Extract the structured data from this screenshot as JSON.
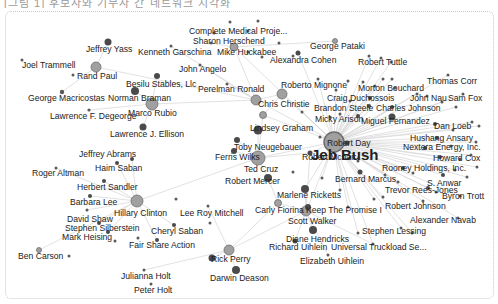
{
  "top_caption": "[그림 1] 후보자와 기부자 간 네트워크 시각화",
  "colors": {
    "edge": "#d9d9d9",
    "candidate_fill": "#a0a0a0",
    "candidate_stroke": "#6e6e6e",
    "donor_fill": "#4a4a4a",
    "small_fill": "#5a5a5a",
    "light_fill": "#9a9a9a",
    "label": "#222222",
    "frame_border": "#c8c8c8"
  },
  "nodes": [
    {
      "id": "jeb",
      "label": "Jeb Bush",
      "x": 334,
      "y": 142,
      "r": 10,
      "kind": "candidate",
      "lx": 311,
      "ly": 160,
      "hub": true
    },
    {
      "id": "hillary",
      "label": "Hillary Clinton",
      "x": 137,
      "y": 201,
      "r": 6,
      "kind": "candidate",
      "lx": 114,
      "ly": 216
    },
    {
      "id": "rand",
      "label": "Rand Paul",
      "x": 96,
      "y": 67,
      "r": 5,
      "kind": "candidate",
      "lx": 77,
      "ly": 79
    },
    {
      "id": "rubio",
      "label": "Marco Rubio",
      "x": 152,
      "y": 104,
      "r": 6,
      "kind": "candidate",
      "lx": 128,
      "ly": 116
    },
    {
      "id": "christie",
      "label": "Chris Christie",
      "x": 256,
      "y": 100,
      "r": 5,
      "kind": "candidate",
      "lx": 258,
      "ly": 107
    },
    {
      "id": "cruz",
      "label": "Ted Cruz",
      "x": 258,
      "y": 158,
      "r": 7,
      "kind": "candidate",
      "lx": 244,
      "ly": 172
    },
    {
      "id": "walker",
      "label": "Scott Walker",
      "x": 306,
      "y": 211,
      "r": 5,
      "kind": "candidate",
      "lx": 288,
      "ly": 224
    },
    {
      "id": "huckabee",
      "label": "Mike Huckabee",
      "x": 234,
      "y": 47,
      "r": 4,
      "kind": "candidate",
      "lx": 217,
      "ly": 55
    },
    {
      "id": "perry",
      "label": "Rick Perry",
      "x": 229,
      "y": 250,
      "r": 5,
      "kind": "candidate",
      "lx": 211,
      "ly": 262
    },
    {
      "id": "graham",
      "label": "Lindsey Graham",
      "x": 263,
      "y": 115,
      "r": 3.5,
      "kind": "candidate",
      "lx": 250,
      "ly": 131
    },
    {
      "id": "fiorina",
      "label": "Carly Fiorina",
      "x": 278,
      "y": 203,
      "r": 3.5,
      "kind": "candidate",
      "lx": 255,
      "ly": 213
    },
    {
      "id": "pataki",
      "label": "George Pataki",
      "x": 335,
      "y": 41,
      "r": 2.5,
      "kind": "candidate",
      "lx": 310,
      "ly": 49
    },
    {
      "id": "carson",
      "label": "Ben Carson",
      "x": 39,
      "y": 250,
      "r": 2.5,
      "kind": "candidate",
      "lx": 18,
      "ly": 259
    },
    {
      "id": "yass",
      "label": "Jeffrey Yass",
      "x": 108,
      "y": 42,
      "r": 3.5,
      "kind": "donor",
      "lx": 86,
      "ly": 52
    },
    {
      "id": "trammell",
      "label": "Joel Trammell",
      "x": 0,
      "y": 0,
      "r": 0,
      "kind": "none",
      "lx": 22,
      "ly": 68
    },
    {
      "id": "macricostas",
      "label": "George Macricostas",
      "x": 62,
      "y": 92,
      "r": 2.2,
      "kind": "small",
      "lx": 28,
      "ly": 101
    },
    {
      "id": "degeorge",
      "label": "Lawrence F. Degeorge",
      "x": 89,
      "y": 110,
      "r": 1.6,
      "kind": "small",
      "lx": 50,
      "ly": 119
    },
    {
      "id": "ellison",
      "label": "Lawrence J. Ellison",
      "x": 143,
      "y": 127,
      "r": 3.5,
      "kind": "donor",
      "lx": 110,
      "ly": 137
    },
    {
      "id": "braman",
      "label": "Norman Braman",
      "x": 135,
      "y": 91,
      "r": 4,
      "kind": "donor",
      "lx": 108,
      "ly": 101
    },
    {
      "id": "besilu",
      "label": "Besilu Stables, Llc",
      "x": 157,
      "y": 76,
      "r": 3,
      "kind": "donor",
      "lx": 126,
      "ly": 87
    },
    {
      "id": "garschina",
      "label": "Kenneth Garschina",
      "x": 171,
      "y": 46,
      "r": 1.5,
      "kind": "small",
      "lx": 138,
      "ly": 55
    },
    {
      "id": "angelo",
      "label": "John Angelo",
      "x": 200,
      "y": 65,
      "r": 1.5,
      "kind": "small",
      "lx": 179,
      "ly": 72
    },
    {
      "id": "perelman",
      "label": "Perelman Ronald",
      "x": 227,
      "y": 84,
      "r": 1.5,
      "kind": "small",
      "lx": 198,
      "ly": 92
    },
    {
      "id": "cmp",
      "label": "Complete Medical Proje...",
      "x": 248,
      "y": 31,
      "r": 1.5,
      "kind": "small",
      "lx": 189,
      "ly": 34
    },
    {
      "id": "herschend",
      "label": "Sharon Herschend",
      "x": 211,
      "y": 43,
      "r": 1.5,
      "kind": "small",
      "lx": 193,
      "ly": 44
    },
    {
      "id": "cohen",
      "label": "Alexandra Cohen",
      "x": 298,
      "y": 53,
      "r": 2.5,
      "kind": "donor",
      "lx": 270,
      "ly": 63
    },
    {
      "id": "mignone",
      "label": "Roberto Mignone",
      "x": 282,
      "y": 94,
      "r": 5,
      "kind": "candidate",
      "lx": 281,
      "ly": 88
    },
    {
      "id": "tuttle",
      "label": "Robert Tuttle",
      "x": 381,
      "y": 58,
      "r": 1.5,
      "kind": "small",
      "lx": 358,
      "ly": 65
    },
    {
      "id": "corr",
      "label": "Thomas Corr",
      "x": 448,
      "y": 75,
      "r": 1.5,
      "kind": "small",
      "lx": 427,
      "ly": 84
    },
    {
      "id": "bouchard",
      "label": "Morton Bouchard",
      "x": 375,
      "y": 86,
      "r": 1.5,
      "kind": "small",
      "lx": 358,
      "ly": 91
    },
    {
      "id": "nau",
      "label": "John Nau",
      "x": 417,
      "y": 94,
      "r": 1.5,
      "kind": "small",
      "lx": 410,
      "ly": 101
    },
    {
      "id": "samfox",
      "label": "Sam Fox",
      "x": 463,
      "y": 94,
      "r": 1.5,
      "kind": "small",
      "lx": 448,
      "ly": 101
    },
    {
      "id": "duchossois",
      "label": "Craig Duchossois",
      "x": 370,
      "y": 98,
      "r": 2,
      "kind": "donor",
      "lx": 327,
      "ly": 101
    },
    {
      "id": "steele",
      "label": "Brandon Steele",
      "x": 369,
      "y": 106,
      "r": 2,
      "kind": "donor",
      "lx": 314,
      "ly": 111
    },
    {
      "id": "cjohnson",
      "label": "Charles Johnson",
      "x": 392,
      "y": 107,
      "r": 2,
      "kind": "donor",
      "lx": 376,
      "ly": 111
    },
    {
      "id": "arison",
      "label": "Micky Arison",
      "x": 358,
      "y": 116,
      "r": 2,
      "kind": "donor",
      "lx": 315,
      "ly": 122
    },
    {
      "id": "fernandez",
      "label": "Miguel Fernandez",
      "x": 392,
      "y": 117,
      "r": 3.5,
      "kind": "donor",
      "lx": 361,
      "ly": 124
    },
    {
      "id": "loeb",
      "label": "Dan Loeb",
      "x": 435,
      "y": 124,
      "r": 2,
      "kind": "donor",
      "lx": 434,
      "ly": 129
    },
    {
      "id": "ansary",
      "label": "Hushang Ansary",
      "x": 437,
      "y": 138,
      "r": 2,
      "kind": "donor",
      "lx": 410,
      "ly": 141
    },
    {
      "id": "nextera",
      "label": "Nextera Energy, Inc.",
      "x": 425,
      "y": 148,
      "r": 2,
      "kind": "donor",
      "lx": 403,
      "ly": 150
    },
    {
      "id": "cox",
      "label": "Howard Cox",
      "x": 440,
      "y": 157,
      "r": 2,
      "kind": "donor",
      "lx": 433,
      "ly": 161
    },
    {
      "id": "rooney",
      "label": "Rooney Holdings, Inc.",
      "x": 403,
      "y": 168,
      "r": 2,
      "kind": "donor",
      "lx": 382,
      "ly": 171
    },
    {
      "id": "anwar",
      "label": "S. Anwar",
      "x": 443,
      "y": 175,
      "r": 2,
      "kind": "donor",
      "lx": 427,
      "ly": 186
    },
    {
      "id": "reesjones",
      "label": "Trevor Rees-Jones",
      "x": 428,
      "y": 188,
      "r": 2,
      "kind": "donor",
      "lx": 385,
      "ly": 193
    },
    {
      "id": "trott",
      "label": "Byron Trott",
      "x": 460,
      "y": 196,
      "r": 1.5,
      "kind": "small",
      "lx": 442,
      "ly": 199
    },
    {
      "id": "rjohnson",
      "label": "Robert Johnson",
      "x": 423,
      "y": 201,
      "r": 1.5,
      "kind": "small",
      "lx": 385,
      "ly": 209
    },
    {
      "id": "navab",
      "label": "Alexander Navab",
      "x": 458,
      "y": 218,
      "r": 1.5,
      "kind": "small",
      "lx": 410,
      "ly": 223
    },
    {
      "id": "lessing",
      "label": "Stephen Lessing",
      "x": 401,
      "y": 228,
      "r": 1.5,
      "kind": "small",
      "lx": 362,
      "ly": 234
    },
    {
      "id": "day",
      "label": "Robert Day",
      "x": 347,
      "y": 143,
      "r": 2.5,
      "kind": "donor",
      "lx": 327,
      "ly": 146
    },
    {
      "id": "mcnair",
      "label": "Robert Mcnair",
      "x": 310,
      "y": 153,
      "r": 2.5,
      "kind": "donor",
      "lx": 302,
      "ly": 160
    },
    {
      "id": "marcus",
      "label": "Bernard Marcus",
      "x": 360,
      "y": 172,
      "r": 2.5,
      "kind": "donor",
      "lx": 335,
      "ly": 182
    },
    {
      "id": "ricketts",
      "label": "Marlene Ricketts",
      "x": 305,
      "y": 189,
      "r": 4,
      "kind": "donor",
      "lx": 277,
      "ly": 198
    },
    {
      "id": "kpi",
      "label": "Keep The Promise I",
      "x": 308,
      "y": 207,
      "r": 3,
      "kind": "donor",
      "lx": 306,
      "ly": 213
    },
    {
      "id": "hendricks",
      "label": "Diane Hendricks",
      "x": 313,
      "y": 230,
      "r": 4,
      "kind": "donor",
      "lx": 286,
      "ly": 242
    },
    {
      "id": "ruihlein",
      "label": "Richard Uihlein",
      "x": 295,
      "y": 241,
      "r": 2.5,
      "kind": "donor",
      "lx": 269,
      "ly": 250
    },
    {
      "id": "utruck",
      "label": "Universal Truckload Se...",
      "x": 373,
      "y": 244,
      "r": 1.5,
      "kind": "small",
      "lx": 331,
      "ly": 250
    },
    {
      "id": "euihlein",
      "label": "Elizabeth Uihlein",
      "x": 328,
      "y": 255,
      "r": 1.5,
      "kind": "small",
      "lx": 300,
      "ly": 264
    },
    {
      "id": "neugebauer",
      "label": "Toby Neugebauer",
      "x": 258,
      "y": 130,
      "r": 4.5,
      "kind": "donor",
      "lx": 234,
      "ly": 150
    },
    {
      "id": "wilks",
      "label": "Ferris Wilks",
      "x": 237,
      "y": 140,
      "r": 3,
      "kind": "donor",
      "lx": 215,
      "ly": 160
    },
    {
      "id": "wilks2",
      "label": "",
      "x": 234,
      "y": 151,
      "r": 3,
      "kind": "donor",
      "lx": 0,
      "ly": 0
    },
    {
      "id": "mercer",
      "label": "Robert Mercer",
      "x": 268,
      "y": 178,
      "r": 4,
      "kind": "donor",
      "lx": 225,
      "ly": 184
    },
    {
      "id": "abrams",
      "label": "Jeffrey Abrams",
      "x": 132,
      "y": 159,
      "r": 2,
      "kind": "donor",
      "lx": 79,
      "ly": 157
    },
    {
      "id": "saban",
      "label": "Haim Saban",
      "x": 117,
      "y": 163,
      "r": 2,
      "kind": "donor",
      "lx": 95,
      "ly": 171
    },
    {
      "id": "altman",
      "label": "Roger Altman",
      "x": 56,
      "y": 168,
      "r": 1.5,
      "kind": "small",
      "lx": 32,
      "ly": 176
    },
    {
      "id": "sandler",
      "label": "Herbert Sandler",
      "x": 104,
      "y": 181,
      "r": 2,
      "kind": "donor",
      "lx": 77,
      "ly": 190
    },
    {
      "id": "blee",
      "label": "Barbara Lee",
      "x": 90,
      "y": 196,
      "r": 2,
      "kind": "donor",
      "lx": 70,
      "ly": 205
    },
    {
      "id": "shaw",
      "label": "David Shaw",
      "x": 87,
      "y": 210,
      "r": 1.5,
      "kind": "small",
      "lx": 67,
      "ly": 222
    },
    {
      "id": "silberstein",
      "label": "Stephen Silberstein",
      "x": 99,
      "y": 223,
      "r": 2,
      "kind": "donor",
      "lx": 65,
      "ly": 231
    },
    {
      "id": "heising",
      "label": "Mark Heising",
      "x": 108,
      "y": 232,
      "r": 2,
      "kind": "donor",
      "lx": 62,
      "ly": 240
    },
    {
      "id": "csaban",
      "label": "Cheryl Saban",
      "x": 174,
      "y": 225,
      "r": 2,
      "kind": "donor",
      "lx": 151,
      "ly": 234
    },
    {
      "id": "fairshare",
      "label": "Fair Share Action",
      "x": 157,
      "y": 240,
      "r": 2,
      "kind": "donor",
      "lx": 129,
      "ly": 248
    },
    {
      "id": "mitchell",
      "label": "Lee Roy Mitchell",
      "x": 208,
      "y": 206,
      "r": 1.5,
      "kind": "small",
      "lx": 180,
      "ly": 216
    },
    {
      "id": "jholt",
      "label": "Julianna Holt",
      "x": 144,
      "y": 270,
      "r": 1.5,
      "kind": "small",
      "lx": 121,
      "ly": 279
    },
    {
      "id": "pholt",
      "label": "Peter Holt",
      "x": 151,
      "y": 284,
      "r": 1.5,
      "kind": "small",
      "lx": 134,
      "ly": 293
    },
    {
      "id": "deason",
      "label": "Darwin Deason",
      "x": 236,
      "y": 270,
      "r": 4,
      "kind": "donor",
      "lx": 210,
      "ly": 281
    },
    {
      "id": "perry2",
      "label": "",
      "x": 212,
      "y": 258,
      "r": 3.5,
      "kind": "donor",
      "lx": 0,
      "ly": 0
    }
  ],
  "edges": [
    [
      "jeb",
      "cohen"
    ],
    [
      "jeb",
      "mignone"
    ],
    [
      "jeb",
      "tuttle"
    ],
    [
      "jeb",
      "corr"
    ],
    [
      "jeb",
      "bouchard"
    ],
    [
      "jeb",
      "nau"
    ],
    [
      "jeb",
      "samfox"
    ],
    [
      "jeb",
      "duchossois"
    ],
    [
      "jeb",
      "steele"
    ],
    [
      "jeb",
      "cjohnson"
    ],
    [
      "jeb",
      "arison"
    ],
    [
      "jeb",
      "fernandez"
    ],
    [
      "jeb",
      "loeb"
    ],
    [
      "jeb",
      "ansary"
    ],
    [
      "jeb",
      "nextera"
    ],
    [
      "jeb",
      "cox"
    ],
    [
      "jeb",
      "rooney"
    ],
    [
      "jeb",
      "anwar"
    ],
    [
      "jeb",
      "reesjones"
    ],
    [
      "jeb",
      "trott"
    ],
    [
      "jeb",
      "rjohnson"
    ],
    [
      "jeb",
      "navab"
    ],
    [
      "jeb",
      "lessing"
    ],
    [
      "jeb",
      "day"
    ],
    [
      "jeb",
      "mcnair"
    ],
    [
      "jeb",
      "marcus"
    ],
    [
      "jeb",
      "ricketts"
    ],
    [
      "jeb",
      "christie"
    ],
    [
      "jeb",
      "graham"
    ],
    [
      "jeb",
      "huckabee"
    ],
    [
      "jeb",
      "kpi"
    ],
    [
      "jeb",
      "utruck"
    ],
    [
      "jeb",
      "cruz"
    ],
    [
      "hillary",
      "abrams"
    ],
    [
      "hillary",
      "saban"
    ],
    [
      "hillary",
      "altman"
    ],
    [
      "hillary",
      "sandler"
    ],
    [
      "hillary",
      "blee"
    ],
    [
      "hillary",
      "shaw"
    ],
    [
      "hillary",
      "silberstein"
    ],
    [
      "hillary",
      "heising"
    ],
    [
      "hillary",
      "csaban"
    ],
    [
      "hillary",
      "fairshare"
    ],
    [
      "hillary",
      "carson"
    ],
    [
      "hillary",
      "cruz"
    ],
    [
      "rand",
      "yass"
    ],
    [
      "rand",
      "trammell_pt"
    ],
    [
      "rand",
      "macricostas"
    ],
    [
      "rand",
      "christie"
    ],
    [
      "rubio",
      "braman"
    ],
    [
      "rubio",
      "besilu"
    ],
    [
      "rubio",
      "ellison"
    ],
    [
      "rubio",
      "degeorge"
    ],
    [
      "rubio",
      "christie"
    ],
    [
      "christie",
      "perelman"
    ],
    [
      "christie",
      "angelo"
    ],
    [
      "christie",
      "garschina"
    ],
    [
      "christie",
      "mignone"
    ],
    [
      "christie",
      "huckabee"
    ],
    [
      "huckabee",
      "cmp"
    ],
    [
      "huckabee",
      "herschend"
    ],
    [
      "huckabee",
      "pataki"
    ],
    [
      "cruz",
      "neugebauer"
    ],
    [
      "cruz",
      "wilks"
    ],
    [
      "cruz",
      "wilks2"
    ],
    [
      "cruz",
      "mercer"
    ],
    [
      "cruz",
      "mcnair"
    ],
    [
      "cruz",
      "graham"
    ],
    [
      "walker",
      "ricketts"
    ],
    [
      "walker",
      "kpi"
    ],
    [
      "walker",
      "hendricks"
    ],
    [
      "walker",
      "ruihlein"
    ],
    [
      "walker",
      "euihlein"
    ],
    [
      "walker",
      "utruck"
    ],
    [
      "walker",
      "fiorina"
    ],
    [
      "walker",
      "mcnair"
    ],
    [
      "perry",
      "perry2"
    ],
    [
      "perry",
      "deason"
    ],
    [
      "perry",
      "mitchell"
    ],
    [
      "perry",
      "jholt"
    ],
    [
      "perry",
      "fiorina"
    ],
    [
      "perry",
      "walker"
    ],
    [
      "fiorina",
      "mercer"
    ],
    [
      "graham",
      "mignone"
    ]
  ],
  "extra_points": [
    {
      "x": 22,
      "y": 60
    },
    {
      "x": 73,
      "y": 75
    },
    {
      "x": 214,
      "y": 33
    },
    {
      "x": 230,
      "y": 22
    },
    {
      "x": 258,
      "y": 21
    },
    {
      "x": 248,
      "y": 52
    },
    {
      "x": 262,
      "y": 57
    },
    {
      "x": 369,
      "y": 56
    },
    {
      "x": 391,
      "y": 62
    },
    {
      "x": 318,
      "y": 79
    },
    {
      "x": 348,
      "y": 81
    },
    {
      "x": 363,
      "y": 82
    },
    {
      "x": 383,
      "y": 79
    },
    {
      "x": 392,
      "y": 79
    },
    {
      "x": 395,
      "y": 88
    },
    {
      "x": 427,
      "y": 96
    },
    {
      "x": 442,
      "y": 102
    },
    {
      "x": 456,
      "y": 107
    },
    {
      "x": 472,
      "y": 122
    },
    {
      "x": 479,
      "y": 126
    },
    {
      "x": 453,
      "y": 130
    },
    {
      "x": 451,
      "y": 146
    },
    {
      "x": 476,
      "y": 142
    },
    {
      "x": 460,
      "y": 159
    },
    {
      "x": 471,
      "y": 155
    },
    {
      "x": 477,
      "y": 167
    },
    {
      "x": 455,
      "y": 170
    },
    {
      "x": 467,
      "y": 177
    },
    {
      "x": 413,
      "y": 173
    },
    {
      "x": 385,
      "y": 175
    },
    {
      "x": 398,
      "y": 182
    },
    {
      "x": 436,
      "y": 192
    },
    {
      "x": 374,
      "y": 199
    },
    {
      "x": 358,
      "y": 161
    },
    {
      "x": 293,
      "y": 172
    },
    {
      "x": 322,
      "y": 178
    },
    {
      "x": 340,
      "y": 190
    },
    {
      "x": 348,
      "y": 207
    },
    {
      "x": 320,
      "y": 137
    },
    {
      "x": 340,
      "y": 114
    },
    {
      "x": 302,
      "y": 112
    },
    {
      "x": 330,
      "y": 117
    },
    {
      "x": 293,
      "y": 56
    },
    {
      "x": 279,
      "y": 43
    },
    {
      "x": 176,
      "y": 199
    },
    {
      "x": 115,
      "y": 241
    },
    {
      "x": 138,
      "y": 238
    },
    {
      "x": 69,
      "y": 256
    },
    {
      "x": 210,
      "y": 223
    },
    {
      "x": 358,
      "y": 233
    },
    {
      "x": 412,
      "y": 233
    },
    {
      "x": 383,
      "y": 197
    },
    {
      "x": 336,
      "y": 90
    },
    {
      "x": 350,
      "y": 101
    }
  ],
  "trammell_pt": {
    "x": 96,
    "y": 67
  }
}
